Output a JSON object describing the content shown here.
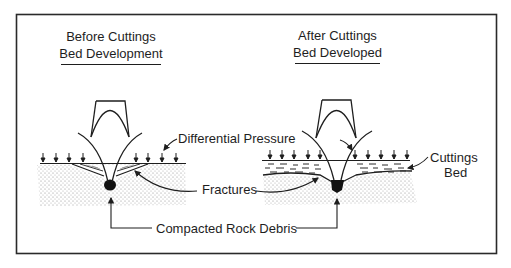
{
  "figure": {
    "panels": [
      {
        "id": "before",
        "title_line1": "Before Cuttings",
        "title_line2": "Bed Development"
      },
      {
        "id": "after",
        "title_line1": "After Cuttings",
        "title_line2": "Bed Developed"
      }
    ],
    "labels": {
      "differential_pressure": "Differential Pressure",
      "fractures": "Fractures",
      "cuttings_bed_line1": "Cuttings",
      "cuttings_bed_line2": "Bed",
      "compacted_rock_debris": "Compacted Rock Debris"
    },
    "colors": {
      "ink": "#1e1e1e",
      "stipple": "#9a9a9a",
      "background": "#ffffff"
    }
  }
}
